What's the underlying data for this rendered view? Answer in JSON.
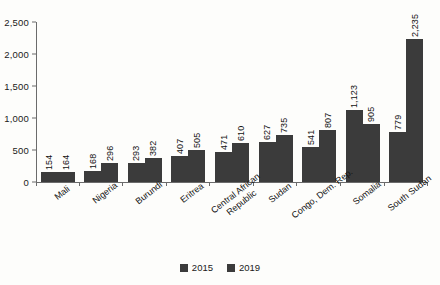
{
  "chart_data": {
    "type": "bar",
    "title": "",
    "subtitle": "",
    "xlabel": "",
    "ylabel": "",
    "ylim": [
      0,
      2500
    ],
    "ytick_values": [
      2500,
      2000,
      1500,
      1000,
      500,
      0
    ],
    "ytick_labels": [
      "2,500",
      "2,000",
      "1,500",
      "1,000",
      "500",
      "0"
    ],
    "grid": false,
    "legend_position": "bottom-center",
    "orientation": "vertical",
    "grouping": "grouped",
    "bar_color": "#3b3b3b",
    "categories": [
      "Mali",
      "Nigeria",
      "Burundi",
      "Eritrea",
      "Central African Republic",
      "Sudan",
      "Congo, Dem. Rep.",
      "Somalia",
      "South Sudan"
    ],
    "category_label_lines": [
      [
        "Mali"
      ],
      [
        "Nigeria"
      ],
      [
        "Burundi"
      ],
      [
        "Eritrea"
      ],
      [
        "Central African",
        "Republic"
      ],
      [
        "Sudan"
      ],
      [
        "Congo, Dem. Rep."
      ],
      [
        "Somalia"
      ],
      [
        "South Sudan"
      ]
    ],
    "series": [
      {
        "name": "2015",
        "color": "#3b3b3b",
        "values": [
          154,
          168,
          293,
          407,
          471,
          627,
          541,
          1123,
          779
        ],
        "labels": [
          "154",
          "168",
          "293",
          "407",
          "471",
          "627",
          "541",
          "1,123",
          "779"
        ]
      },
      {
        "name": "2019",
        "color": "#3b3b3b",
        "values": [
          164,
          296,
          382,
          505,
          610,
          735,
          807,
          905,
          2235
        ],
        "labels": [
          "164",
          "296",
          "382",
          "505",
          "610",
          "735",
          "807",
          "905",
          "2,235"
        ]
      }
    ]
  },
  "legend": {
    "items": [
      {
        "label": "2015",
        "color": "#3b3b3b"
      },
      {
        "label": "2019",
        "color": "#3b3b3b"
      }
    ]
  }
}
